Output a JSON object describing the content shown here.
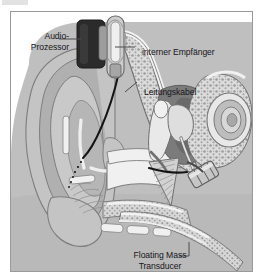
{
  "figure": {
    "language": "de",
    "frame_border_color": "#9a9a9a",
    "background_color": "#ffffff"
  },
  "callouts": [
    {
      "id": "audio-processor",
      "lines": [
        "Audio-",
        "Prozessor"
      ],
      "line1": "Audio-",
      "line2": "Prozessor",
      "align": "right",
      "leader": "horizontal-right"
    },
    {
      "id": "internal-receiver",
      "lines": [
        "interner Empfänger"
      ],
      "line1": "interner Empfänger",
      "align": "left",
      "leader": "horizontal-left"
    },
    {
      "id": "lead-cable",
      "lines": [
        "Leitungskabel"
      ],
      "line1": "Leitungskabel",
      "align": "left",
      "leader": "diagonal-left-down"
    },
    {
      "id": "floating-mass-transducer",
      "lines": [
        "Floating Mass",
        "Transducer"
      ],
      "line1": "Floating Mass",
      "line2": "Transducer",
      "align": "center",
      "leader": "diagonal-right-up"
    }
  ],
  "colors": {
    "text": "#17161a",
    "leader_line": "#4c4c4c",
    "frame": "#9a9a9a",
    "skin_outer": "#c9c9c9",
    "skin_mid": "#b4b4b4",
    "cartilage": "#a8a8a8",
    "bone_light": "#dcdcdc",
    "bone_stipple": "#8e8e8e",
    "cavity_dark": "#6f6f6f",
    "cavity_darker": "#5c5c5c",
    "ossicle": "#e4e4e4",
    "device_dark": "#2b2b2b",
    "device_light": "#cfcfcf",
    "canal_white": "#f2f2f2",
    "wire_black": "#141414"
  },
  "structures": [
    {
      "name": "pinna",
      "label_de": "Ohrmuschel"
    },
    {
      "name": "ear-canal",
      "label_de": "Gehörgang"
    },
    {
      "name": "eardrum",
      "label_de": "Trommelfell"
    },
    {
      "name": "ossicles",
      "label_de": "Gehörknöchelchen"
    },
    {
      "name": "cochlea",
      "label_de": "Schnecke"
    },
    {
      "name": "mastoid-bone",
      "label_de": "Warzenfortsatz"
    },
    {
      "name": "eustachian-tube",
      "label_de": "Ohrtrompete"
    }
  ],
  "devices": [
    {
      "name": "audio-processor",
      "type": "external",
      "shape": "rounded-rect",
      "color": "#2b2b2b"
    },
    {
      "name": "internal-receiver",
      "type": "implant",
      "shape": "capsule",
      "color": "#cfcfcf"
    },
    {
      "name": "lead-cable",
      "type": "implant",
      "shape": "curved-wire",
      "color": "#141414"
    },
    {
      "name": "floating-mass-transducer",
      "type": "implant",
      "shape": "cylinder",
      "color": "#c2c2c2"
    }
  ]
}
